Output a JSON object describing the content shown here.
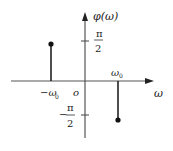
{
  "diagram": {
    "y_axis_label": "φ(ω)",
    "x_axis_label": "ω",
    "origin_label": "o",
    "ticks": {
      "pos_half_pi": {
        "numerator": "π",
        "denominator": "2",
        "sign": ""
      },
      "neg_half_pi": {
        "numerator": "π",
        "denominator": "2",
        "sign": "−"
      }
    },
    "x_markers": {
      "neg": "−ω",
      "neg_sub": "0",
      "pos": "ω",
      "pos_sub": "0"
    },
    "stems": [
      {
        "x": "-ω0",
        "value": "π/2"
      },
      {
        "x": "ω0",
        "value": "-π/2"
      }
    ],
    "colors": {
      "line": "#222222",
      "axis": "#555555"
    }
  }
}
